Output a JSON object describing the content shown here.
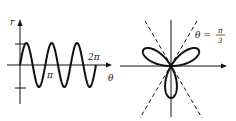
{
  "figure": {
    "left_panel": {
      "type": "cartesian",
      "function": "r = sin 3θ",
      "y_axis_label": "r",
      "x_axis_label": "θ",
      "x_tick_labels": [
        "π",
        "2π"
      ],
      "y_ticks": [
        1,
        -1
      ],
      "x_range": [
        0,
        6.2832
      ],
      "periods": 3
    },
    "right_panel": {
      "type": "polar",
      "curve": "three-leaved rose",
      "petal_angles_deg": [
        30,
        150,
        270
      ],
      "asymptote_label_lhs": "θ =",
      "asymptote_label_num": "π",
      "asymptote_label_den": "3",
      "dashed_lines_deg": [
        60,
        120
      ]
    },
    "colors": {
      "stroke": "#111111",
      "background": "#ffffff"
    }
  },
  "chart_data": {
    "type": "line",
    "title": "",
    "xlabel": "θ",
    "ylabel": "r",
    "x_ticks": [
      "π",
      "2π"
    ],
    "series": [
      {
        "name": "r = sin 3θ",
        "x": [
          0,
          0.5236,
          1.0472,
          1.5708,
          2.0944,
          2.618,
          3.1416,
          3.6652,
          4.1888,
          4.7124,
          5.236,
          5.7596,
          6.2832
        ],
        "values": [
          0,
          1,
          0,
          -1,
          0,
          1,
          0,
          -1,
          0,
          1,
          0,
          -1,
          0
        ]
      }
    ],
    "ylim": [
      -1,
      1
    ],
    "xlim": [
      0,
      6.2832
    ],
    "grid": false
  }
}
